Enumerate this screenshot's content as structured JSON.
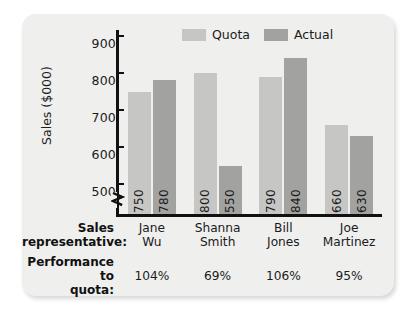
{
  "chart_data": {
    "type": "bar",
    "title": "",
    "xlabel": "Sales representative:",
    "ylabel": "Sales ($000)",
    "ylim": [
      460,
      900
    ],
    "yticks": [
      500,
      600,
      700,
      800,
      900
    ],
    "ytick_labels": [
      "500",
      "600",
      "700",
      "800",
      "900"
    ],
    "grid": false,
    "axis_break": true,
    "legend_position": "top-center",
    "categories": [
      "Jane Wu",
      "Shanna Smith",
      "Bill Jones",
      "Joe Martinez"
    ],
    "series": [
      {
        "name": "Quota",
        "color": "#c6c6c4",
        "values": [
          750,
          800,
          790,
          660
        ]
      },
      {
        "name": "Actual",
        "color": "#a2a2a0",
        "values": [
          780,
          550,
          840,
          630
        ]
      }
    ],
    "annotations": {
      "performance_to_quota": [
        "104%",
        "69%",
        "106%",
        "95%"
      ]
    }
  },
  "chart": {
    "y_axis_title": "Sales ($000)",
    "y_ticks": [
      "900",
      "800",
      "700",
      "600",
      "500"
    ]
  },
  "legend": {
    "items": [
      {
        "label": "Quota"
      },
      {
        "label": "Actual"
      }
    ]
  },
  "bars": [
    {
      "label": "750",
      "series": "Quota",
      "category": "Jane Wu"
    },
    {
      "label": "780",
      "series": "Actual",
      "category": "Jane Wu"
    },
    {
      "label": "800",
      "series": "Quota",
      "category": "Shanna Smith"
    },
    {
      "label": "550",
      "series": "Actual",
      "category": "Shanna Smith"
    },
    {
      "label": "790",
      "series": "Quota",
      "category": "Bill Jones"
    },
    {
      "label": "840",
      "series": "Actual",
      "category": "Bill Jones"
    },
    {
      "label": "660",
      "series": "Quota",
      "category": "Joe Martinez"
    },
    {
      "label": "630",
      "series": "Actual",
      "category": "Joe Martinez"
    }
  ],
  "table": {
    "row1_label_line1": "Sales",
    "row1_label_line2": "representative:",
    "row2_label_line1": "Performance to",
    "row2_label_line2": "quota:",
    "names": [
      {
        "line1": "Jane",
        "line2": "Wu"
      },
      {
        "line1": "Shanna",
        "line2": "Smith"
      },
      {
        "line1": "Bill",
        "line2": "Jones"
      },
      {
        "line1": "Joe",
        "line2": "Martinez"
      }
    ],
    "performance": [
      "104%",
      "69%",
      "106%",
      "95%"
    ]
  }
}
